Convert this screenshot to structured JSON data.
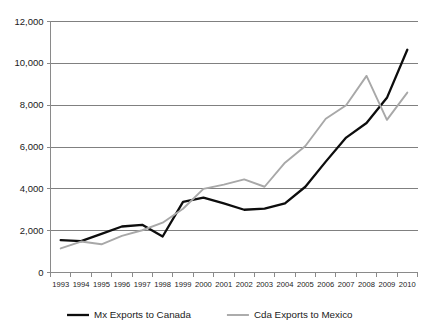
{
  "chart_data": {
    "type": "line",
    "title": "",
    "subtitle": "",
    "xlabel": "",
    "ylabel": "",
    "x": [
      1993,
      1994,
      1995,
      1996,
      1997,
      1998,
      1999,
      2000,
      2001,
      2002,
      2003,
      2004,
      2005,
      2006,
      2007,
      2008,
      2009,
      2010
    ],
    "categories": [
      "1993",
      "1994",
      "1995",
      "1996",
      "1997",
      "1998",
      "1999",
      "2000",
      "2001",
      "2002",
      "2003",
      "2004",
      "2005",
      "2006",
      "2007",
      "2008",
      "2009",
      "2010"
    ],
    "series": [
      {
        "name": "Mx Exports to Canada",
        "color": "#0d0d0d",
        "values": [
          1550,
          1500,
          1850,
          2200,
          2280,
          1720,
          3380,
          3580,
          3300,
          3000,
          3050,
          3300,
          4100,
          5300,
          6450,
          7150,
          8350,
          10650
        ]
      },
      {
        "name": "Cda Exports to Mexico",
        "color": "#a8a8a8",
        "values": [
          1150,
          1480,
          1350,
          1750,
          2020,
          2380,
          3050,
          4000,
          4200,
          4450,
          4100,
          5250,
          6050,
          7350,
          8000,
          9400,
          7300,
          8600
        ]
      }
    ],
    "ylim": [
      0,
      12000
    ],
    "ytick_values": [
      0,
      2000,
      4000,
      6000,
      8000,
      10000,
      12000
    ],
    "ytick_labels": [
      "0",
      "2,000",
      "4,000",
      "6,000",
      "8,000",
      "10,000",
      "12,000"
    ],
    "grid": true,
    "grid_axis": "y",
    "legend_position": "bottom"
  },
  "legend": {
    "items": [
      {
        "label": "Mx Exports to Canada",
        "color": "#0d0d0d"
      },
      {
        "label": "Cda Exports to Mexico",
        "color": "#a8a8a8"
      }
    ]
  },
  "colors": {
    "series_a": "#0d0d0d",
    "series_b": "#a8a8a8",
    "grid": "#808080",
    "axis": "#8a8a8a",
    "text": "#1a1a1a",
    "background": "#ffffff"
  }
}
